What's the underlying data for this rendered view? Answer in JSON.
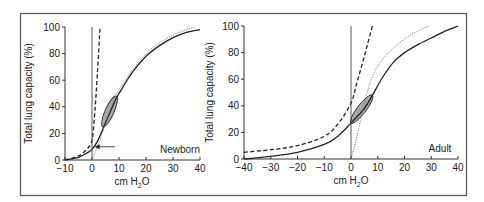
{
  "chart_data": [
    {
      "type": "line",
      "panel_label": "Newborn",
      "xlabel": "cm H2O",
      "ylabel": "Total lung capacity (%)",
      "xlim": [
        -10,
        40
      ],
      "ylim": [
        0,
        100
      ],
      "xticks": [
        -10,
        0,
        10,
        20,
        30,
        40
      ],
      "yticks": [
        0,
        20,
        40,
        60,
        80,
        100
      ],
      "series": [
        {
          "name": "respiratory system (solid)",
          "style": "solid",
          "x": [
            -10,
            -5,
            -2,
            0,
            2,
            5,
            8,
            10,
            15,
            20,
            25,
            30,
            35,
            40
          ],
          "y": [
            0,
            2,
            5,
            8,
            14,
            28,
            42,
            50,
            66,
            78,
            86,
            92,
            96,
            98
          ]
        },
        {
          "name": "lung (dotted)",
          "style": "dotted",
          "x": [
            0,
            2,
            5,
            8,
            10,
            15,
            20,
            25,
            30,
            35,
            38
          ],
          "y": [
            0,
            10,
            27,
            45,
            53,
            68,
            80,
            88,
            94,
            98,
            100
          ]
        },
        {
          "name": "chest wall (dashed)",
          "style": "dashed",
          "x": [
            -10,
            -5,
            -2,
            0,
            1,
            2,
            3
          ],
          "y": [
            0,
            3,
            8,
            15,
            35,
            65,
            100
          ]
        },
        {
          "name": "zero pressure line",
          "style": "solid-thin",
          "x": [
            0,
            0
          ],
          "y": [
            0,
            100
          ]
        }
      ],
      "annotations": [
        {
          "type": "arrow",
          "from": [
            8.5,
            10
          ],
          "to": [
            1,
            10
          ],
          "note": "points to FRC on curve"
        },
        {
          "type": "tidal-loop",
          "center": [
            6.5,
            37
          ],
          "ends": [
            [
              4,
              25
            ],
            [
              9,
              48
            ]
          ]
        }
      ]
    },
    {
      "type": "line",
      "panel_label": "Adult",
      "xlabel": "cm H2O",
      "ylabel": "Total lung capacity (%)",
      "xlim": [
        -40,
        40
      ],
      "ylim": [
        0,
        100
      ],
      "xticks": [
        -40,
        -30,
        -20,
        -10,
        0,
        10,
        20,
        30,
        40
      ],
      "yticks": [
        0,
        20,
        40,
        60,
        80,
        100
      ],
      "series": [
        {
          "name": "respiratory system (solid)",
          "style": "solid",
          "x": [
            -40,
            -30,
            -20,
            -10,
            -5,
            0,
            5,
            8,
            12,
            16,
            20,
            25,
            30,
            35,
            40
          ],
          "y": [
            0,
            2,
            5,
            11,
            17,
            27,
            38,
            48,
            62,
            73,
            80,
            86,
            91,
            96,
            100
          ]
        },
        {
          "name": "lung (dotted)",
          "style": "dotted",
          "x": [
            0,
            2,
            4,
            6,
            8,
            10,
            14,
            18,
            22,
            26,
            29
          ],
          "y": [
            0,
            15,
            33,
            50,
            62,
            70,
            80,
            87,
            93,
            97,
            100
          ]
        },
        {
          "name": "chest wall (dashed)",
          "style": "dashed",
          "x": [
            -40,
            -30,
            -20,
            -10,
            -5,
            0,
            2,
            4,
            6,
            8
          ],
          "y": [
            5,
            7,
            10,
            17,
            26,
            42,
            56,
            70,
            85,
            100
          ]
        },
        {
          "name": "zero pressure line",
          "style": "solid-thin",
          "x": [
            0,
            0
          ],
          "y": [
            0,
            100
          ]
        }
      ],
      "annotations": [
        {
          "type": "tidal-loop",
          "center": [
            4,
            37
          ],
          "ends": [
            [
              0,
              27
            ],
            [
              8,
              48
            ]
          ]
        }
      ]
    }
  ],
  "labels": {
    "left_title": "Newborn",
    "right_title": "Adult",
    "xlabel_prefix": "cm H",
    "xlabel_sub": "2",
    "xlabel_suffix": "O",
    "ylabel": "Total lung capacity (%)"
  }
}
